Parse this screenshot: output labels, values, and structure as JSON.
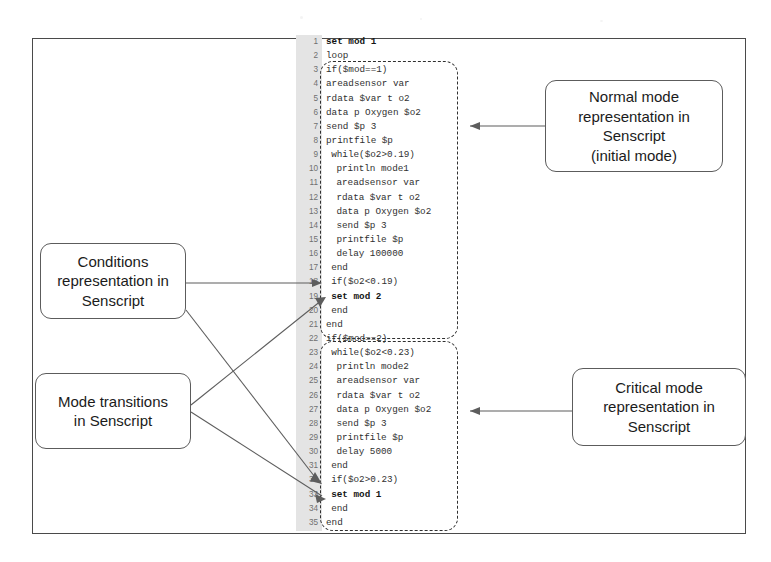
{
  "figure": {
    "kind": "annotated-code-listing",
    "language": "Senscript"
  },
  "code": {
    "gutter_label": "line-numbers",
    "lines": [
      {
        "n": "1",
        "indent": 0,
        "text": "set mod 1",
        "bold": true
      },
      {
        "n": "2",
        "indent": 0,
        "text": "loop",
        "bold": false
      },
      {
        "n": "3",
        "indent": 0,
        "text": "if($mod==1)",
        "bold": false
      },
      {
        "n": "4",
        "indent": 0,
        "text": "areadsensor var",
        "bold": false
      },
      {
        "n": "5",
        "indent": 0,
        "text": "rdata $var t o2",
        "bold": false
      },
      {
        "n": "6",
        "indent": 0,
        "text": "data p Oxygen $o2",
        "bold": false
      },
      {
        "n": "7",
        "indent": 0,
        "text": "send $p 3",
        "bold": false
      },
      {
        "n": "8",
        "indent": 0,
        "text": "printfile $p",
        "bold": false
      },
      {
        "n": "9",
        "indent": 1,
        "text": "while($o2>0.19)",
        "bold": false
      },
      {
        "n": "10",
        "indent": 2,
        "text": "println mode1",
        "bold": false
      },
      {
        "n": "11",
        "indent": 2,
        "text": "areadsensor var",
        "bold": false
      },
      {
        "n": "12",
        "indent": 2,
        "text": "rdata $var t o2",
        "bold": false
      },
      {
        "n": "13",
        "indent": 2,
        "text": "data p Oxygen $o2",
        "bold": false
      },
      {
        "n": "14",
        "indent": 2,
        "text": "send $p 3",
        "bold": false
      },
      {
        "n": "15",
        "indent": 2,
        "text": "printfile $p",
        "bold": false
      },
      {
        "n": "16",
        "indent": 2,
        "text": "delay 100000",
        "bold": false
      },
      {
        "n": "17",
        "indent": 1,
        "text": "end",
        "bold": false
      },
      {
        "n": "18",
        "indent": 1,
        "text": "if($o2<0.19)",
        "bold": false
      },
      {
        "n": "19",
        "indent": 1,
        "text": "set mod 2",
        "bold": true
      },
      {
        "n": "20",
        "indent": 1,
        "text": "end",
        "bold": false
      },
      {
        "n": "21",
        "indent": 0,
        "text": "end",
        "bold": false
      },
      {
        "n": "22",
        "indent": 0,
        "text": "if($mod==2)",
        "bold": false
      },
      {
        "n": "23",
        "indent": 1,
        "text": "while($o2<0.23)",
        "bold": false
      },
      {
        "n": "24",
        "indent": 2,
        "text": "println mode2",
        "bold": false
      },
      {
        "n": "25",
        "indent": 2,
        "text": "areadsensor var",
        "bold": false
      },
      {
        "n": "26",
        "indent": 2,
        "text": "rdata $var t o2",
        "bold": false
      },
      {
        "n": "27",
        "indent": 2,
        "text": "data p Oxygen $o2",
        "bold": false
      },
      {
        "n": "28",
        "indent": 2,
        "text": "send $p 3",
        "bold": false
      },
      {
        "n": "29",
        "indent": 2,
        "text": "printfile $p",
        "bold": false
      },
      {
        "n": "30",
        "indent": 2,
        "text": "delay 5000",
        "bold": false
      },
      {
        "n": "31",
        "indent": 1,
        "text": "end",
        "bold": false
      },
      {
        "n": "32",
        "indent": 1,
        "text": "if($o2>0.23)",
        "bold": false
      },
      {
        "n": "33",
        "indent": 1,
        "text": "set mod 1",
        "bold": true
      },
      {
        "n": "34",
        "indent": 1,
        "text": "end",
        "bold": false
      },
      {
        "n": "35",
        "indent": 0,
        "text": "end",
        "bold": false
      }
    ]
  },
  "regions": {
    "normal": {
      "label": "normal-mode-region"
    },
    "critical": {
      "label": "critical-mode-region"
    }
  },
  "callouts": {
    "normal_mode": {
      "line1": "Normal mode",
      "line2": "representation in",
      "line3": "Senscript",
      "line4": "(initial mode)"
    },
    "critical_mode": {
      "line1": "Critical mode",
      "line2": "representation in",
      "line3": "Senscript"
    },
    "conditions": {
      "line1": "Conditions",
      "line2": "representation in",
      "line3": "Senscript"
    },
    "mode_transitions": {
      "line1": "Mode transitions",
      "line2": "in Senscript"
    }
  },
  "colors": {
    "frame": "#4a4a4a",
    "gutter": "#e4e4e4",
    "code_text": "#303030",
    "line_number": "#707070",
    "dashed_region": "#2f2f2f",
    "callout_border": "#5c5c5c",
    "connector": "#5d5d5d",
    "background": "#ffffff"
  }
}
